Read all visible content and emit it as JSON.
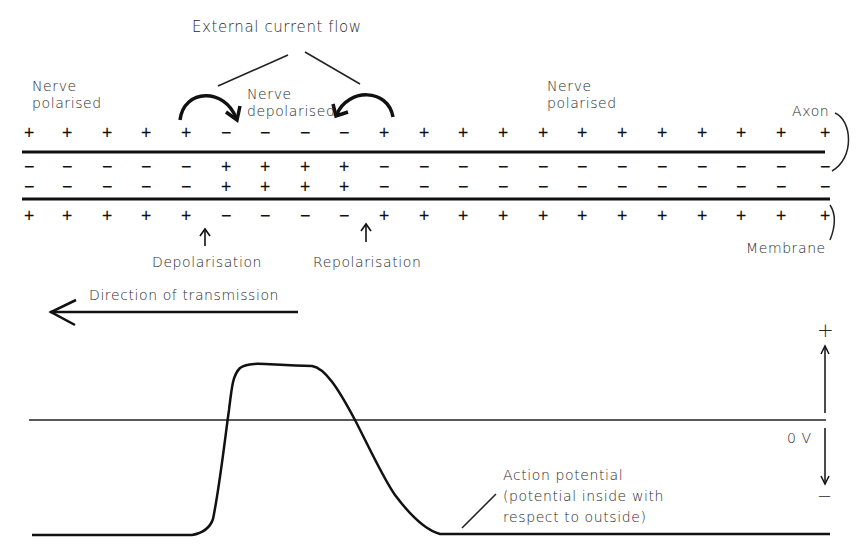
{
  "diagram": {
    "labels": {
      "external_current_flow": "External current flow",
      "nerve_polarised_left": "Nerve\npolarised",
      "nerve_depolarised": "Nerve\ndepolarised",
      "nerve_polarised_right": "Nerve\npolarised",
      "axon": "Axon",
      "membrane": "Membrane",
      "depolarisation": "Depolarisation",
      "repolarisation": "Repolarisation",
      "direction_of_transmission": "Direction of transmission",
      "action_potential": "Action potential\n(potential inside with\nrespect to outside)",
      "zero_volts": "0 V",
      "axis_plus": "+",
      "axis_minus": "−"
    },
    "columns_x": [
      29,
      67,
      107,
      146,
      186,
      226,
      265,
      305,
      344,
      384,
      424,
      463,
      503,
      543,
      582,
      622,
      662,
      702,
      741,
      781,
      825
    ],
    "rows": {
      "outside_top": [
        "+",
        "+",
        "+",
        "+",
        "+",
        "−",
        "−",
        "−",
        "−",
        "+",
        "+",
        "+",
        "+",
        "+",
        "+",
        "+",
        "+",
        "+",
        "+",
        "+",
        "+"
      ],
      "inside_upper": [
        "−",
        "−",
        "−",
        "−",
        "−",
        "+",
        "+",
        "+",
        "+",
        "−",
        "−",
        "−",
        "−",
        "−",
        "−",
        "−",
        "−",
        "−",
        "−",
        "−",
        "−"
      ],
      "inside_lower": [
        "−",
        "−",
        "−",
        "−",
        "−",
        "+",
        "+",
        "+",
        "+",
        "−",
        "−",
        "−",
        "−",
        "−",
        "−",
        "−",
        "−",
        "−",
        "−",
        "−",
        "−"
      ],
      "outside_bottom": [
        "+",
        "+",
        "+",
        "+",
        "+",
        "−",
        "−",
        "−",
        "−",
        "+",
        "+",
        "+",
        "+",
        "+",
        "+",
        "+",
        "+",
        "+",
        "+",
        "+",
        "+"
      ]
    },
    "rows_y": {
      "outside_top": 132,
      "inside_upper": 166,
      "inside_lower": 186,
      "outside_bottom": 215
    },
    "colors": {
      "ink": "#111111",
      "background": "#ffffff"
    }
  }
}
